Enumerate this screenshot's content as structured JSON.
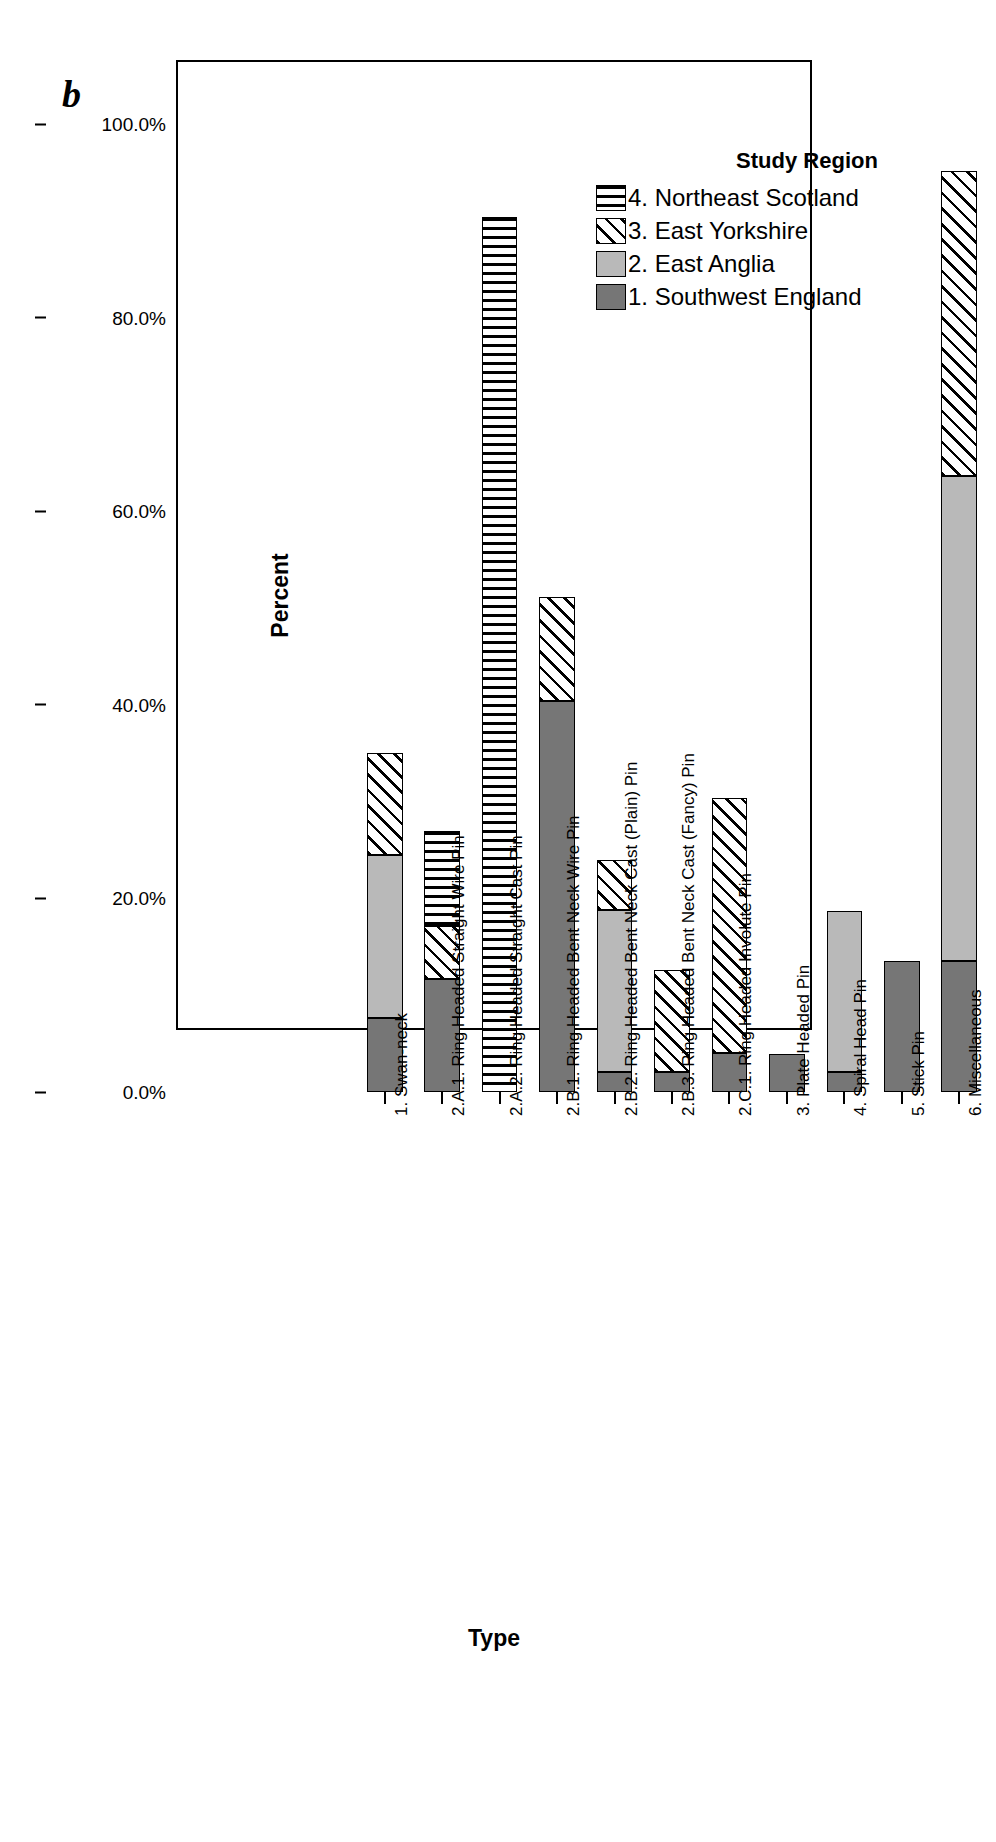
{
  "panel_letter": "b",
  "legend": {
    "title": "Study Region",
    "items": [
      {
        "label": "4. Northeast Scotland",
        "pattern": "horizontal-stripes",
        "key": "f4"
      },
      {
        "label": "3. East Yorkshire",
        "pattern": "diagonal-stripes",
        "key": "f3"
      },
      {
        "label": "2. East Anglia",
        "pattern": "light-grey-solid",
        "key": "f2"
      },
      {
        "label": "1. Southwest England",
        "pattern": "dark-grey-solid",
        "key": "f1"
      }
    ]
  },
  "axes": {
    "y_title": "Percent",
    "x_title": "Type",
    "y_ticks": [
      "0.0%",
      "20.0%",
      "40.0%",
      "60.0%",
      "80.0%",
      "100.0%"
    ]
  },
  "chart_data": {
    "type": "bar",
    "title": "",
    "subtitle": "",
    "xlabel": "Type",
    "ylabel": "Percent",
    "ylim": [
      0,
      100
    ],
    "yticks": [
      0,
      20,
      40,
      60,
      80,
      100
    ],
    "ytick_labels": [
      "0.0%",
      "20.0%",
      "40.0%",
      "60.0%",
      "80.0%",
      "100.0%"
    ],
    "grid": false,
    "stacked": true,
    "legend_position": "top-right",
    "legend_title": "Study Region",
    "categories": [
      "1. Swan-neck",
      "2.A.1. Ring Headed Straight Wire Pin",
      "2.A.2. Ring Headed Straight Cast Pin",
      "2.B.1. Ring Headed Bent Neck Wire Pin",
      "2.B.2. Ring Headed Bent Neck Cast (Plain) Pin",
      "2.B.3. Ring Headed Bent Neck Cast (Fancy) Pin",
      "2.C.1. Ring Headed Involute Pin",
      "3. Plate Headed Pin",
      "4. Spiral Head Pin",
      "5. Stick Pin",
      "6. Miscellaneous"
    ],
    "series": [
      {
        "name": "1. Southwest England",
        "values": [
          7.6,
          11.7,
          0.0,
          40.4,
          2.1,
          2.1,
          4.0,
          3.9,
          2.1,
          13.5,
          13.5
        ]
      },
      {
        "name": "2. East Anglia",
        "values": [
          16.9,
          0.0,
          0.0,
          0.0,
          16.7,
          0.0,
          0.0,
          0.0,
          16.6,
          0.0,
          50.1
        ]
      },
      {
        "name": "3. East Yorkshire",
        "values": [
          10.5,
          5.4,
          0.0,
          10.7,
          5.2,
          10.5,
          26.4,
          0.0,
          0.0,
          0.0,
          31.5
        ]
      },
      {
        "name": "4. Northeast Scotland",
        "values": [
          0.0,
          9.9,
          90.4,
          0.0,
          0.0,
          0.0,
          0.0,
          0.0,
          0.0,
          0.0,
          0.0
        ]
      }
    ],
    "totals": [
      35.0,
      27.0,
      90.4,
      51.1,
      24.0,
      12.6,
      30.4,
      3.9,
      18.7,
      13.5,
      95.1
    ]
  }
}
